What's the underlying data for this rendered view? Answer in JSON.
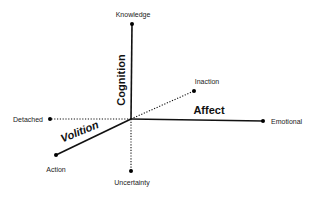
{
  "diagram": {
    "type": "3d-axes",
    "axes": [
      {
        "name": "Cognition",
        "poles": [
          "Knowledge",
          "Uncertainty"
        ]
      },
      {
        "name": "Affect",
        "poles": [
          "Emotional",
          "Detached"
        ]
      },
      {
        "name": "Volition",
        "poles": [
          "Action",
          "Inaction"
        ]
      }
    ],
    "labels": {
      "cognition": "Cognition",
      "affect": "Affect",
      "volition": "Volition",
      "knowledge": "Knowledge",
      "uncertainty": "Uncertainty",
      "emotional": "Emotional",
      "detached": "Detached",
      "action": "Action",
      "inaction": "Inaction"
    },
    "colors": {
      "line": "#111111",
      "text": "#222222",
      "background": "#ffffff"
    }
  }
}
